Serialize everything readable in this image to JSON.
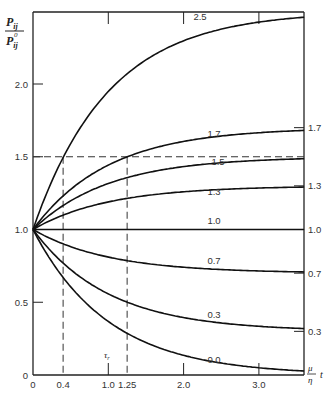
{
  "chart_data": {
    "type": "line",
    "title": "",
    "ylabel": "P_ij / P_ij^0",
    "ylabel_num": "P",
    "ylabel_num_sub": "ij",
    "ylabel_den": "P",
    "ylabel_den_sub": "ij",
    "ylabel_den_sup": "0",
    "xlabel": "(μ/η) t",
    "xlabel_num": "μ",
    "xlabel_den": "η",
    "xlabel_var": "t",
    "xlim": [
      0,
      3.6
    ],
    "ylim": [
      0,
      2.5
    ],
    "x_ticks": [
      "0",
      "0.4",
      "1.0",
      "1.25",
      "2.0",
      "3.0"
    ],
    "x_tick_values": [
      0,
      0.4,
      1.0,
      1.25,
      2.0,
      3.0
    ],
    "y_ticks": [
      "0",
      "0.5",
      "1.0",
      "1.5",
      "2.0"
    ],
    "y_tick_values": [
      0,
      0.5,
      1.0,
      1.5,
      2.0
    ],
    "right_ticks": [
      "1.7",
      "1.3",
      "1.0",
      "0.7",
      "0.3"
    ],
    "annotation_tau": "τ",
    "annotation_tau_sub": "r",
    "x": [
      0,
      0.2,
      0.4,
      0.6,
      0.8,
      1.0,
      1.25,
      1.5,
      2.0,
      2.5,
      3.0,
      3.5
    ],
    "series": [
      {
        "name": "2.5",
        "values": [
          1.0,
          1.27,
          1.49,
          1.68,
          1.83,
          1.95,
          2.07,
          2.17,
          2.3,
          2.38,
          2.43,
          2.45
        ]
      },
      {
        "name": "1.7",
        "values": [
          1.0,
          1.13,
          1.23,
          1.32,
          1.39,
          1.44,
          1.5,
          1.54,
          1.61,
          1.64,
          1.67,
          1.68
        ]
      },
      {
        "name": "1.5",
        "values": [
          1.0,
          1.09,
          1.16,
          1.23,
          1.27,
          1.32,
          1.36,
          1.39,
          1.43,
          1.46,
          1.48,
          1.48
        ]
      },
      {
        "name": "1.3",
        "values": [
          1.0,
          1.05,
          1.1,
          1.14,
          1.17,
          1.19,
          1.21,
          1.23,
          1.26,
          1.28,
          1.29,
          1.29
        ]
      },
      {
        "name": "1.0",
        "values": [
          1.0,
          1.0,
          1.0,
          1.0,
          1.0,
          1.0,
          1.0,
          1.0,
          1.0,
          1.0,
          1.0,
          1.0
        ]
      },
      {
        "name": "0.7",
        "values": [
          1.0,
          0.95,
          0.9,
          0.86,
          0.83,
          0.81,
          0.79,
          0.77,
          0.74,
          0.72,
          0.71,
          0.71
        ]
      },
      {
        "name": "0.3",
        "values": [
          1.0,
          0.87,
          0.77,
          0.68,
          0.61,
          0.56,
          0.5,
          0.46,
          0.39,
          0.36,
          0.33,
          0.32
        ]
      },
      {
        "name": "0.0",
        "values": [
          1.0,
          0.82,
          0.67,
          0.55,
          0.45,
          0.37,
          0.29,
          0.22,
          0.14,
          0.08,
          0.05,
          0.03
        ]
      }
    ],
    "reference_lines": [
      {
        "type": "horizontal",
        "y": 1.5,
        "style": "dashed"
      },
      {
        "type": "vertical",
        "x": 0.4,
        "style": "dashed"
      },
      {
        "type": "vertical",
        "x": 1.25,
        "style": "dashed"
      }
    ],
    "grid": false,
    "legend": "inline labels on curves"
  }
}
